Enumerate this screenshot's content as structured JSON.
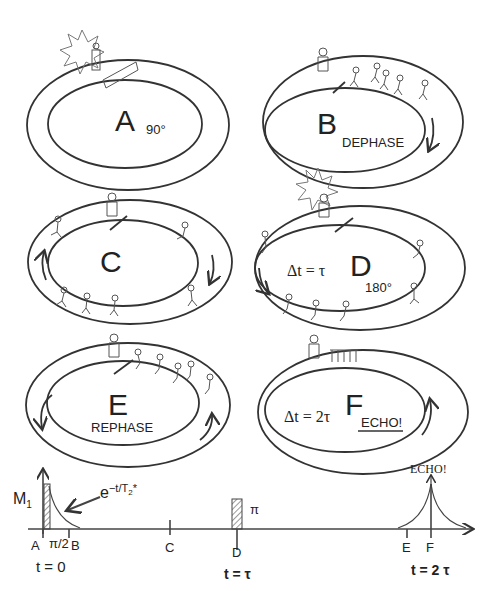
{
  "panels": [
    {
      "id": "A",
      "letter": "A",
      "caption": "90°"
    },
    {
      "id": "B",
      "letter": "B",
      "caption": "DEPHASE"
    },
    {
      "id": "C",
      "letter": "C",
      "caption": ""
    },
    {
      "id": "D",
      "letter": "D",
      "caption": "180°",
      "delta": "Δt = τ"
    },
    {
      "id": "E",
      "letter": "E",
      "caption": "REPHASE"
    },
    {
      "id": "F",
      "letter": "F",
      "caption": "ECHO!",
      "delta": "Δt = 2τ"
    }
  ],
  "timeline": {
    "y_label": "M",
    "y_label_sub": "1",
    "decay_label": "e",
    "decay_exp": "−t/T",
    "decay_exp_sub": "2",
    "decay_exp_star": "*",
    "pulse1_label": "π/2",
    "pulse2_label": "π",
    "echo_label": "ECHO!",
    "ticks": [
      "A",
      "B",
      "C",
      "D",
      "E",
      "F"
    ],
    "times": [
      "t = 0",
      "t = τ",
      "t = 2 τ"
    ]
  },
  "colors": {
    "stroke": "#333333",
    "background": "#ffffff"
  }
}
